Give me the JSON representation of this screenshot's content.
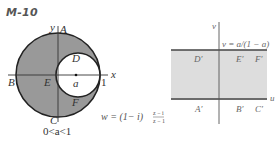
{
  "title": "M-10",
  "left_panel": {
    "axis_labels": {
      "x": "x",
      "y": "y"
    },
    "points": {
      "A": "A",
      "B": "B",
      "C": "C",
      "D": "D",
      "E": "E",
      "F": "F"
    },
    "center_label": "a",
    "one_label": "1",
    "condition": "0<a<1",
    "fill_color": "#999999"
  },
  "mapping": {
    "prefix": "w = (1− i)",
    "numerator": "z − i",
    "denominator": "z − 1"
  },
  "right_panel": {
    "axis_labels": {
      "u": "u",
      "v": "v"
    },
    "line_label": "v = a/(1 − a)",
    "points": {
      "A": "A′",
      "B": "B′",
      "C": "C′",
      "D": "D′",
      "E": "E′",
      "F": "F′"
    },
    "fill_color": "#dddddd"
  }
}
